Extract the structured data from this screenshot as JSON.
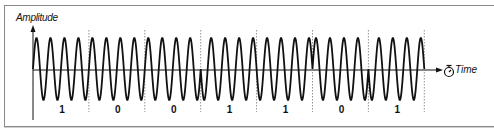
{
  "diagram": {
    "type": "phase-shift-keying-waveform",
    "y_axis_label": "Amplitude",
    "x_axis_label": "Time",
    "x_axis_icon": "stopwatch-icon",
    "cycles_per_bit": 4,
    "bits": [
      {
        "value": "1",
        "phase": 0
      },
      {
        "value": "0",
        "phase": 0
      },
      {
        "value": "0",
        "phase": 0
      },
      {
        "value": "1",
        "phase": 180
      },
      {
        "value": "1",
        "phase": 180
      },
      {
        "value": "0",
        "phase": 0
      },
      {
        "value": "1",
        "phase": 180
      }
    ],
    "colors": {
      "wave": "#111111",
      "axis": "#111111",
      "boundary": "#777777",
      "frame": "#8a8a8a"
    }
  }
}
